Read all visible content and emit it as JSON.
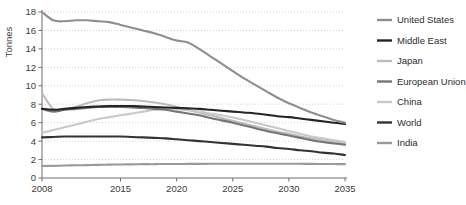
{
  "chart_data": {
    "type": "line",
    "title": "",
    "xlabel": "",
    "ylabel": "Tonnes",
    "xlim": [
      2008,
      2035
    ],
    "ylim": [
      0,
      18
    ],
    "grid": true,
    "legend_position": "right",
    "xticks": [
      "2008",
      "2015",
      "2020",
      "2025",
      "2030",
      "2035"
    ],
    "xtick_values": [
      2008,
      2015,
      2020,
      2025,
      2030,
      2035
    ],
    "yticks": [
      "0",
      "2",
      "4",
      "6",
      "8",
      "10",
      "12",
      "14",
      "16",
      "18"
    ],
    "ytick_values": [
      0,
      2,
      4,
      6,
      8,
      10,
      12,
      14,
      16,
      18
    ],
    "x": [
      2008,
      2009,
      2010,
      2011,
      2012,
      2013,
      2014,
      2015,
      2016,
      2017,
      2018,
      2019,
      2020,
      2021,
      2022,
      2023,
      2024,
      2025,
      2026,
      2027,
      2028,
      2029,
      2030,
      2031,
      2032,
      2033,
      2034,
      2035
    ],
    "series": [
      {
        "name": "United States",
        "color": "#8e8e8e",
        "values": [
          18.0,
          17.1,
          17.0,
          17.1,
          17.1,
          17.0,
          16.9,
          16.6,
          16.3,
          16.0,
          15.7,
          15.3,
          14.9,
          14.7,
          14.0,
          13.2,
          12.4,
          11.6,
          10.8,
          10.1,
          9.4,
          8.7,
          8.1,
          7.6,
          7.1,
          6.7,
          6.3,
          6.0
        ]
      },
      {
        "name": "Middle East",
        "color": "#242424",
        "values": [
          7.5,
          7.4,
          7.5,
          7.6,
          7.7,
          7.75,
          7.8,
          7.8,
          7.8,
          7.75,
          7.7,
          7.65,
          7.6,
          7.55,
          7.5,
          7.4,
          7.3,
          7.2,
          7.1,
          7.0,
          6.85,
          6.7,
          6.6,
          6.45,
          6.3,
          6.15,
          6.0,
          5.85
        ]
      },
      {
        "name": "Japan",
        "color": "#bcbcbc",
        "values": [
          9.2,
          7.5,
          7.4,
          7.7,
          8.1,
          8.4,
          8.5,
          8.5,
          8.45,
          8.35,
          8.2,
          8.0,
          7.7,
          7.4,
          7.1,
          6.8,
          6.5,
          6.2,
          5.9,
          5.6,
          5.3,
          5.0,
          4.8,
          4.5,
          4.3,
          4.1,
          3.9,
          3.7
        ]
      },
      {
        "name": "European Union",
        "color": "#757575",
        "values": [
          7.5,
          7.2,
          7.4,
          7.5,
          7.6,
          7.7,
          7.7,
          7.7,
          7.65,
          7.6,
          7.5,
          7.4,
          7.2,
          7.0,
          6.8,
          6.5,
          6.25,
          6.0,
          5.7,
          5.4,
          5.1,
          4.85,
          4.6,
          4.35,
          4.1,
          3.9,
          3.75,
          3.6
        ]
      },
      {
        "name": "China",
        "color": "#c9c9c9",
        "values": [
          4.9,
          5.2,
          5.5,
          5.8,
          6.1,
          6.4,
          6.6,
          6.8,
          7.0,
          7.2,
          7.4,
          7.5,
          7.45,
          7.35,
          7.2,
          7.0,
          6.8,
          6.55,
          6.3,
          6.0,
          5.7,
          5.4,
          5.1,
          4.8,
          4.5,
          4.3,
          4.1,
          3.9
        ]
      },
      {
        "name": "World",
        "color": "#333333",
        "values": [
          4.4,
          4.45,
          4.5,
          4.5,
          4.5,
          4.5,
          4.5,
          4.5,
          4.45,
          4.4,
          4.35,
          4.3,
          4.2,
          4.1,
          4.0,
          3.9,
          3.8,
          3.7,
          3.6,
          3.5,
          3.4,
          3.25,
          3.15,
          3.0,
          2.9,
          2.75,
          2.65,
          2.5
        ]
      },
      {
        "name": "India",
        "color": "#9a9a9a",
        "values": [
          1.3,
          1.32,
          1.35,
          1.38,
          1.4,
          1.42,
          1.45,
          1.47,
          1.48,
          1.5,
          1.5,
          1.52,
          1.52,
          1.53,
          1.53,
          1.54,
          1.54,
          1.55,
          1.55,
          1.55,
          1.55,
          1.55,
          1.54,
          1.54,
          1.53,
          1.52,
          1.51,
          1.5
        ]
      }
    ]
  },
  "axes": {
    "y_title": "Tonnes",
    "axis_color": "#6e6e6e",
    "grid_color": "#c8c8c8",
    "tick_text_color": "#3b3b3b"
  },
  "legend": {
    "items": [
      {
        "label": "United States",
        "color": "#8e8e8e"
      },
      {
        "label": "Middle East",
        "color": "#242424"
      },
      {
        "label": "Japan",
        "color": "#bcbcbc"
      },
      {
        "label": "European Union",
        "color": "#757575"
      },
      {
        "label": "China",
        "color": "#c9c9c9"
      },
      {
        "label": "World",
        "color": "#333333"
      },
      {
        "label": "India",
        "color": "#9a9a9a"
      }
    ]
  }
}
